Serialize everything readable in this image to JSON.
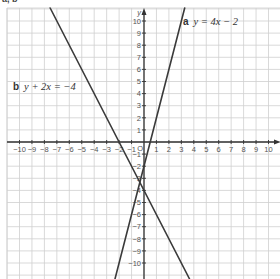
{
  "heading": "a, b",
  "chart_data": {
    "type": "line",
    "title": "",
    "xlabel": "x",
    "ylabel": "y",
    "xlim": [
      -10,
      10
    ],
    "ylim": [
      -10,
      10
    ],
    "grid": true,
    "x_ticks": [
      -10,
      -9,
      -8,
      -7,
      -6,
      -5,
      -4,
      -3,
      -2,
      -1,
      1,
      2,
      3,
      4,
      5,
      6,
      7,
      8,
      9,
      10
    ],
    "y_ticks": [
      -10,
      -9,
      -8,
      -7,
      -6,
      -5,
      -4,
      -3,
      -2,
      -1,
      1,
      2,
      3,
      4,
      5,
      6,
      7,
      8,
      9,
      10
    ],
    "origin_label": "O",
    "series": [
      {
        "name": "a",
        "label": "a",
        "equation": "y = 4x − 2",
        "slope": 4,
        "intercept": -2,
        "x": [
          -2,
          3.25
        ],
        "y": [
          -10,
          11
        ]
      },
      {
        "name": "b",
        "label": "b",
        "equation": "y + 2x = −4",
        "slope": -2,
        "intercept": -4,
        "x": [
          -7.5,
          3.5
        ],
        "y": [
          11,
          -11
        ]
      }
    ],
    "annotations": [
      {
        "text": "a  y = 4x − 2",
        "near_x": 3.5,
        "near_y": 10
      },
      {
        "text": "b  y + 2x = −4",
        "near_x": -9.5,
        "near_y": 5.2
      }
    ]
  },
  "labels": {
    "a_letter": "a",
    "a_eq": "y = 4x − 2",
    "b_letter": "b",
    "b_eq": "y + 2x = −4",
    "x_axis": "x",
    "y_axis": "y",
    "origin": "O"
  }
}
